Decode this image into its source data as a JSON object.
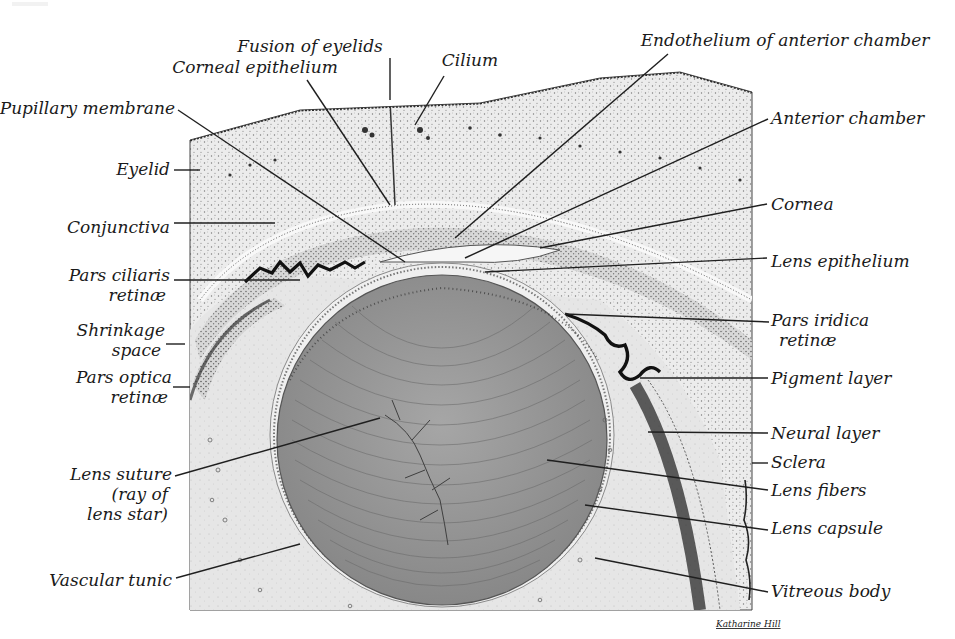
{
  "figure": {
    "signature": "Katharine Hill"
  },
  "labels": {
    "left": [
      {
        "id": "pupillary-membrane",
        "lines": [
          "Pupillary membrane"
        ],
        "x": 175,
        "y": 114,
        "anchor": "end",
        "leader": [
          [
            178,
            110
          ],
          [
            405,
            262
          ]
        ]
      },
      {
        "id": "eyelid",
        "lines": [
          "Eyelid"
        ],
        "x": 170,
        "y": 175,
        "anchor": "end",
        "leader": [
          [
            174,
            170
          ],
          [
            200,
            170
          ]
        ]
      },
      {
        "id": "conjunctiva",
        "lines": [
          "Conjunctiva"
        ],
        "x": 170,
        "y": 233,
        "anchor": "end",
        "leader": [
          [
            174,
            223
          ],
          [
            275,
            223
          ]
        ]
      },
      {
        "id": "pars-ciliaris-retinae",
        "lines": [
          "Pars ciliaris",
          "retinæ"
        ],
        "x": 170,
        "y": 281,
        "anchor": "end",
        "leader": [
          [
            174,
            280
          ],
          [
            300,
            280
          ]
        ]
      },
      {
        "id": "shrinkage-space",
        "lines": [
          "Shrinkage",
          "space"
        ],
        "x": 165,
        "y": 336,
        "anchor": "end",
        "leader": [
          [
            166,
            344
          ],
          [
            185,
            344
          ]
        ]
      },
      {
        "id": "pars-optica-retinae",
        "lines": [
          "Pars optica",
          "retinæ"
        ],
        "x": 172,
        "y": 383,
        "anchor": "end",
        "leader": [
          [
            173,
            387
          ],
          [
            190,
            387
          ]
        ]
      },
      {
        "id": "lens-suture",
        "lines": [
          "Lens suture",
          "(ray of",
          "lens star)"
        ],
        "x": 172,
        "y": 480,
        "anchor": "end",
        "leader": [
          [
            175,
            476
          ],
          [
            380,
            418
          ]
        ]
      },
      {
        "id": "vascular-tunic",
        "lines": [
          "Vascular tunic"
        ],
        "x": 172,
        "y": 586,
        "anchor": "end",
        "leader": [
          [
            176,
            578
          ],
          [
            300,
            544
          ]
        ]
      }
    ],
    "top": [
      {
        "id": "fusion-of-eyelids",
        "lines": [
          "Fusion of eyelids"
        ],
        "x": 310,
        "y": 52,
        "anchor": "middle",
        "leader": [
          [
            390,
            58
          ],
          [
            390,
            100
          ]
        ]
      },
      {
        "id": "corneal-epithelium",
        "lines": [
          "Corneal epithelium"
        ],
        "x": 255,
        "y": 73,
        "anchor": "middle",
        "leader": [
          [
            307,
            80
          ],
          [
            390,
            205
          ]
        ]
      },
      {
        "id": "cilium",
        "lines": [
          "Cilium"
        ],
        "x": 470,
        "y": 66,
        "anchor": "middle",
        "leader": [
          [
            444,
            76
          ],
          [
            415,
            125
          ]
        ]
      },
      {
        "id": "endothelium-anterior-chamber",
        "lines": [
          "Endothelium of anterior chamber"
        ],
        "x": 785,
        "y": 46,
        "anchor": "middle",
        "leader": [
          [
            668,
            54
          ],
          [
            455,
            238
          ]
        ]
      }
    ],
    "right": [
      {
        "id": "anterior-chamber",
        "lines": [
          "Anterior chamber"
        ],
        "x": 771,
        "y": 124,
        "anchor": "start",
        "leader": [
          [
            768,
            119
          ],
          [
            465,
            258
          ]
        ]
      },
      {
        "id": "cornea",
        "lines": [
          "Cornea"
        ],
        "x": 771,
        "y": 210,
        "anchor": "start",
        "leader": [
          [
            767,
            204
          ],
          [
            540,
            248
          ]
        ]
      },
      {
        "id": "lens-epithelium",
        "lines": [
          "Lens epithelium"
        ],
        "x": 771,
        "y": 267,
        "anchor": "start",
        "leader": [
          [
            767,
            258
          ],
          [
            485,
            272
          ]
        ]
      },
      {
        "id": "pars-iridica-retinae",
        "lines": [
          "Pars iridica",
          "retinæ"
        ],
        "x": 771,
        "y": 326,
        "anchor": "start",
        "leader": [
          [
            769,
            322
          ],
          [
            565,
            314
          ]
        ]
      },
      {
        "id": "pigment-layer",
        "lines": [
          "Pigment layer"
        ],
        "x": 771,
        "y": 384,
        "anchor": "start",
        "leader": [
          [
            768,
            378
          ],
          [
            640,
            378
          ]
        ]
      },
      {
        "id": "neural-layer",
        "lines": [
          "Neural layer"
        ],
        "x": 771,
        "y": 439,
        "anchor": "start",
        "leader": [
          [
            768,
            433
          ],
          [
            648,
            432
          ]
        ]
      },
      {
        "id": "sclera",
        "lines": [
          "Sclera"
        ],
        "x": 771,
        "y": 468,
        "anchor": "start",
        "leader": [
          [
            768,
            463
          ],
          [
            752,
            463
          ]
        ]
      },
      {
        "id": "lens-fibers",
        "lines": [
          "Lens fibers"
        ],
        "x": 771,
        "y": 496,
        "anchor": "start",
        "leader": [
          [
            768,
            490
          ],
          [
            547,
            460
          ]
        ]
      },
      {
        "id": "lens-capsule",
        "lines": [
          "Lens capsule"
        ],
        "x": 771,
        "y": 534,
        "anchor": "start",
        "leader": [
          [
            768,
            530
          ],
          [
            585,
            505
          ]
        ]
      },
      {
        "id": "vitreous-body",
        "lines": [
          "Vitreous body"
        ],
        "x": 771,
        "y": 597,
        "anchor": "start",
        "leader": [
          [
            768,
            592
          ],
          [
            595,
            558
          ]
        ]
      }
    ]
  },
  "colors": {
    "background": "#ffffff",
    "tissue_light": "#e9e9e9",
    "tissue_stipple": "#d3d3d3",
    "cornea_band": "#dcdcdc",
    "chamber": "#f4f4f4",
    "lens_fill": "#9a9a9a",
    "lens_fiber": "#6e6e6e",
    "pigment": "#141414",
    "ink": "#1a1a1a"
  }
}
